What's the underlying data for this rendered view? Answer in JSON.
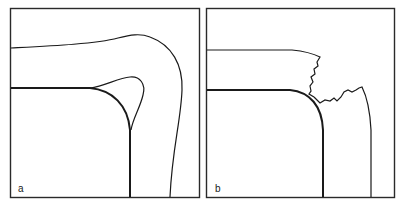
{
  "figure": {
    "panels": [
      {
        "id": "a",
        "label": "a",
        "description": "smooth bent layer around rounded corner with cusp loop"
      },
      {
        "id": "b",
        "label": "b",
        "description": "fractured layer around rounded corner with jagged crack"
      }
    ],
    "colors": {
      "line": "#1a1a1a",
      "frame": "#2a2a2a",
      "background": "#ffffff"
    }
  }
}
